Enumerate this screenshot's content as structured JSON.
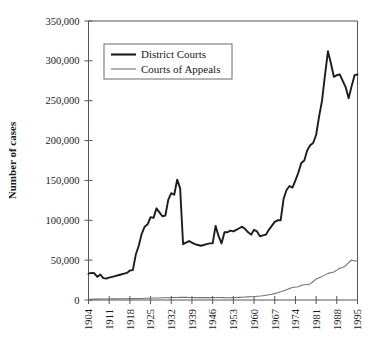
{
  "chart_data": {
    "type": "line",
    "title": "",
    "xlabel": "",
    "ylabel": "Number of cases",
    "xlim": [
      1904,
      1995
    ],
    "ylim": [
      0,
      350000
    ],
    "grid": false,
    "legend_position": "top-left-inside",
    "ytick_labels": [
      "0",
      "50,000",
      "100,000",
      "150,000",
      "200,000",
      "250,000",
      "300,000",
      "350,000"
    ],
    "ytick_values": [
      0,
      50000,
      100000,
      150000,
      200000,
      250000,
      300000,
      350000
    ],
    "xtick_labels": [
      "1904",
      "1911",
      "1918",
      "1925",
      "1932",
      "1939",
      "1946",
      "1953",
      "1960",
      "1967",
      "1974",
      "1981",
      "1988",
      "1995"
    ],
    "xtick_values": [
      1904,
      1911,
      1918,
      1925,
      1932,
      1939,
      1946,
      1953,
      1960,
      1967,
      1974,
      1981,
      1988,
      1995
    ],
    "x": [
      1904,
      1905,
      1906,
      1907,
      1908,
      1909,
      1910,
      1911,
      1912,
      1913,
      1914,
      1915,
      1916,
      1917,
      1918,
      1919,
      1920,
      1921,
      1922,
      1923,
      1924,
      1925,
      1926,
      1927,
      1928,
      1929,
      1930,
      1931,
      1932,
      1933,
      1934,
      1935,
      1936,
      1937,
      1938,
      1939,
      1940,
      1941,
      1942,
      1943,
      1944,
      1945,
      1946,
      1947,
      1948,
      1949,
      1950,
      1951,
      1952,
      1953,
      1954,
      1955,
      1956,
      1957,
      1958,
      1959,
      1960,
      1961,
      1962,
      1963,
      1964,
      1965,
      1966,
      1967,
      1968,
      1969,
      1970,
      1971,
      1972,
      1973,
      1974,
      1975,
      1976,
      1977,
      1978,
      1979,
      1980,
      1981,
      1982,
      1983,
      1984,
      1985,
      1986,
      1987,
      1988,
      1989,
      1990,
      1991,
      1992,
      1993,
      1994,
      1995
    ],
    "series": [
      {
        "name": "District Courts",
        "color": "#1c1c1c",
        "line_width": "thick",
        "values": [
          33000,
          34000,
          33500,
          29000,
          32000,
          27500,
          27000,
          28000,
          29000,
          30000,
          31000,
          32000,
          33000,
          34000,
          37000,
          37500,
          57000,
          68000,
          83000,
          92000,
          95000,
          104000,
          103000,
          115000,
          110000,
          105000,
          106000,
          126000,
          134000,
          132000,
          151000,
          140000,
          70000,
          72000,
          74000,
          72000,
          70000,
          69000,
          68000,
          69000,
          70000,
          71000,
          71000,
          93000,
          80000,
          71000,
          85000,
          85000,
          87000,
          86000,
          88000,
          90000,
          92000,
          89000,
          85000,
          82000,
          88000,
          86000,
          80000,
          81000,
          82000,
          88000,
          93000,
          98000,
          100000,
          100000,
          127000,
          138000,
          143000,
          141000,
          150000,
          160000,
          172000,
          175000,
          188000,
          194000,
          197000,
          207000,
          230000,
          250000,
          282000,
          312000,
          297000,
          280000,
          282000,
          283000,
          275000,
          267000,
          253000,
          268000,
          282000,
          283000
        ]
      },
      {
        "name": "Courts of Appeals",
        "color": "#6f6f6f",
        "line_width": "thin",
        "values": [
          1000,
          1000,
          1100,
          1100,
          1200,
          1200,
          1300,
          1300,
          1400,
          1400,
          1500,
          1500,
          1600,
          1600,
          1700,
          1700,
          1800,
          1900,
          2000,
          2100,
          2200,
          2300,
          2400,
          2500,
          2600,
          2700,
          2800,
          2900,
          3000,
          3100,
          3200,
          3300,
          3300,
          3300,
          3200,
          3100,
          3000,
          3000,
          3000,
          3000,
          3000,
          3000,
          3000,
          3100,
          3200,
          3200,
          3000,
          2900,
          2900,
          3000,
          3100,
          3300,
          3500,
          3700,
          3900,
          4100,
          4200,
          4800,
          5000,
          5400,
          6000,
          6700,
          7200,
          8000,
          9000,
          10200,
          11700,
          12800,
          14500,
          15600,
          16400,
          16700,
          18400,
          19100,
          19400,
          20200,
          23200,
          26300,
          27900,
          29600,
          31500,
          33400,
          34300,
          35200,
          37500,
          39900,
          40900,
          43000,
          47000,
          50200,
          49000,
          49000
        ]
      }
    ]
  },
  "legend": {
    "entries": [
      {
        "label": "District Courts"
      },
      {
        "label": "Courts of Appeals"
      }
    ]
  }
}
